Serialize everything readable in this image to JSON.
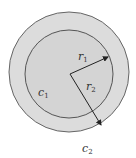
{
  "diagram": {
    "type": "concentric-circles",
    "colors": {
      "background": "#ffffff",
      "outer_fill": "#dcdcdc",
      "inner_fill": "#d4d4d4",
      "stroke": "#555555",
      "arrow": "#222222"
    },
    "outer_circle": {
      "label": "c",
      "subscript": "2",
      "cx": 69,
      "cy": 72,
      "r": 60
    },
    "inner_circle": {
      "label": "c",
      "subscript": "1",
      "cx": 69,
      "cy": 74,
      "r": 44
    },
    "center": {
      "x": 70,
      "y": 74
    },
    "radii": [
      {
        "label": "r",
        "subscript": "1",
        "to": {
          "x": 108,
          "y": 57
        }
      },
      {
        "label": "r",
        "subscript": "2",
        "to": {
          "x": 101,
          "y": 125
        }
      }
    ]
  }
}
